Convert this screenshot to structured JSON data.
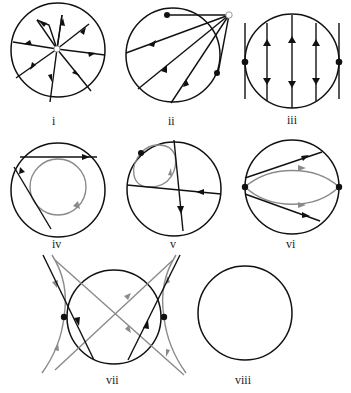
{
  "figure": {
    "colors": {
      "primary_line": "#111111",
      "secondary_line": "#8a8a8a",
      "background": "#ffffff"
    },
    "panels": [
      {
        "id": "i",
        "label": "i",
        "content": "radial source: 8 rays from a hollow center point, arrows pointing outward"
      },
      {
        "id": "ii",
        "label": "ii",
        "content": "hollow point outside circle with lines fanning into circle, two black fixed points on circle"
      },
      {
        "id": "iii",
        "label": "iii",
        "content": "vertical parallel lines, alternating arrow directions, black points at left/right tangent lines"
      },
      {
        "id": "iv",
        "label": "iv",
        "content": "gray closed orbit with clockwise arrow, two black chords with arrows"
      },
      {
        "id": "v",
        "label": "v",
        "content": "gray loop attached to black boundary point, two crossing black chords with arrows"
      },
      {
        "id": "vi",
        "label": "vi",
        "content": "two black boundary points with gray arcs and black chords, arrows to the right"
      },
      {
        "id": "vii",
        "label": "vii",
        "content": "hyperbolic curves and crossing gray lines, black tangent points at left/right"
      },
      {
        "id": "viii",
        "label": "viii",
        "content": "empty circle"
      }
    ]
  }
}
